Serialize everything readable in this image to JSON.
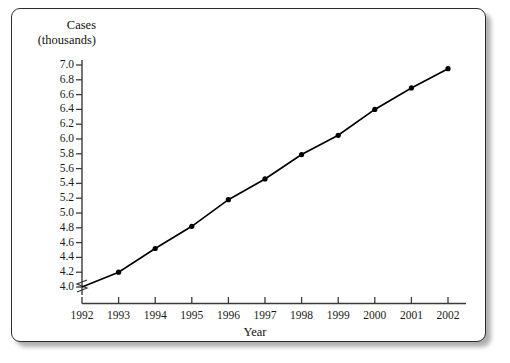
{
  "chart_data": {
    "type": "line",
    "title": "",
    "xlabel": "Year",
    "ylabel": "Cases (thousands)",
    "ylabel_line1": "Cases",
    "ylabel_line2": "(thousands)",
    "x": [
      1992,
      1993,
      1994,
      1995,
      1996,
      1997,
      1998,
      1999,
      2000,
      2001,
      2002
    ],
    "values": [
      4.0,
      4.2,
      4.52,
      4.82,
      5.18,
      5.46,
      5.79,
      6.05,
      6.4,
      6.69,
      6.95
    ],
    "xtick_labels": [
      "1992",
      "1993",
      "1994",
      "1995",
      "1996",
      "1997",
      "1998",
      "1999",
      "2000",
      "2001",
      "2002"
    ],
    "ytick_labels": [
      "4.0",
      "4.2",
      "4.4",
      "4.6",
      "4.8",
      "5.0",
      "5.2",
      "5.4",
      "5.6",
      "5.8",
      "6.0",
      "6.2",
      "6.4",
      "6.6",
      "6.8",
      "7.0"
    ],
    "ytick_values": [
      4.0,
      4.2,
      4.4,
      4.6,
      4.8,
      5.0,
      5.2,
      5.4,
      5.6,
      5.8,
      6.0,
      6.2,
      6.4,
      6.6,
      6.8,
      7.0
    ],
    "ylim": [
      4.0,
      7.0
    ],
    "xlim": [
      1992,
      2002
    ],
    "grid": false,
    "legend": false,
    "axis_break": true,
    "marker": "filled-circle",
    "line_color": "#000000",
    "marker_color": "#000000",
    "axis_color": "#3a3a3a",
    "frame_color": "#2b2b2b",
    "background_color": "#ffffff"
  }
}
